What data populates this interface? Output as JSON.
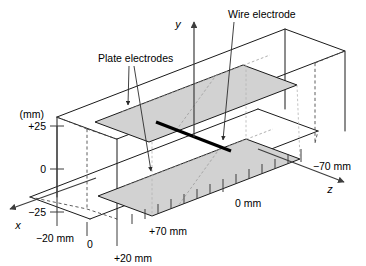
{
  "figure": {
    "colors": {
      "plate_fill": "#d2d2d2",
      "edge": "#1a1a1a",
      "hidden_edge": "#4d4d4d",
      "wire": "#000000",
      "axis": "#3d3d3d",
      "background": "#ffffff"
    }
  },
  "callouts": {
    "plate_electrodes": "Plate electrodes",
    "wire_electrode": "Wire electrode"
  },
  "axes": {
    "x_label": "x",
    "y_label": "y",
    "z_label": "z"
  },
  "y_scale": {
    "unit_label": "(mm)",
    "ticks": [
      {
        "label": "+25",
        "value": 25
      },
      {
        "label": "0",
        "value": 0
      },
      {
        "label": "−25",
        "value": -25
      }
    ]
  },
  "x_scale": {
    "ticks": [
      {
        "label": "−20 mm",
        "value": -20
      },
      {
        "label": "0",
        "value": 0
      },
      {
        "label": "+20 mm",
        "value": 20
      }
    ]
  },
  "z_scale": {
    "ticks": [
      {
        "label": "+70 mm",
        "value": 70
      },
      {
        "label": "0 mm",
        "value": 0
      },
      {
        "label": "−70 mm",
        "value": -70
      }
    ]
  }
}
